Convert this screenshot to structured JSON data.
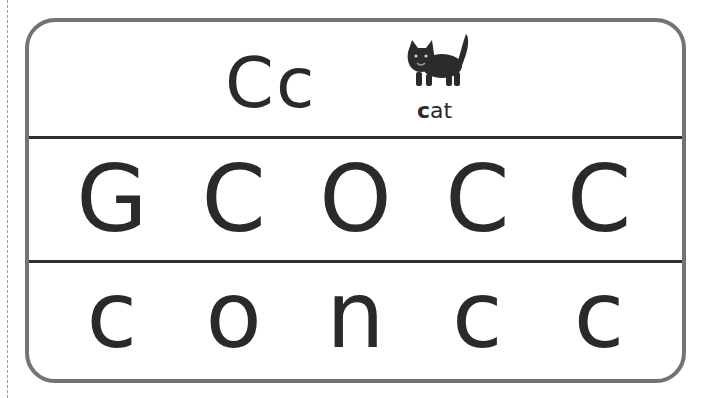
{
  "header": {
    "letter_pair": "Cc",
    "picture": "cat-picture",
    "word_first": "c",
    "word_rest": "at"
  },
  "uppercase_row": {
    "letters": [
      "G",
      "C",
      "O",
      "C",
      "C"
    ]
  },
  "lowercase_row": {
    "letters": [
      "c",
      "o",
      "n",
      "c",
      "c"
    ]
  },
  "colors": {
    "frame": "#737373",
    "divider": "#2f2f2f",
    "ink": "#2a2a2a"
  }
}
